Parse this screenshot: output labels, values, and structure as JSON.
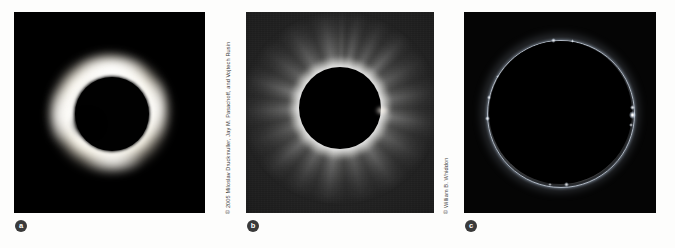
{
  "figure": {
    "background_color": "#fdfdfc",
    "panel_count": 3
  },
  "panels": [
    {
      "id": "a",
      "label": "a",
      "credit": "Jay M. Pasachoff and Shelly B. Kimmel, Williams College Expedition",
      "description": "inner corona and chromosphere ring around dark lunar disk",
      "sky_color": "#000000",
      "corona_color": "#fffdf6",
      "moon_color": "#010101"
    },
    {
      "id": "b",
      "label": "b",
      "credit": "© 2005 Miloslav Druckmuller, Jay M. Pasachoff, and Vojtech Rusin",
      "description": "processed white-light corona with radial streamers",
      "sky_color": "#1c1c1c",
      "corona_color": "#ffffff",
      "moon_color": "#000000"
    },
    {
      "id": "c",
      "label": "c",
      "credit": "© William B. Whiddon",
      "description": "thin bright chromospheric ring with Baily's beads",
      "sky_color": "#050505",
      "corona_color": "#d7e1f0",
      "moon_color": "#000000"
    }
  ],
  "beads": {
    "panel_c": [
      {
        "angle_deg": 92,
        "size": 4.0,
        "intensity": 1.0
      },
      {
        "angle_deg": 86,
        "size": 2.6,
        "intensity": 0.85
      },
      {
        "angle_deg": 100,
        "size": 2.0,
        "intensity": 0.7
      },
      {
        "angle_deg": 175,
        "size": 2.4,
        "intensity": 0.8
      },
      {
        "angle_deg": 188,
        "size": 1.8,
        "intensity": 0.6
      },
      {
        "angle_deg": 265,
        "size": 2.8,
        "intensity": 0.85
      },
      {
        "angle_deg": 282,
        "size": 2.2,
        "intensity": 0.75
      },
      {
        "angle_deg": 300,
        "size": 1.8,
        "intensity": 0.6
      },
      {
        "angle_deg": 355,
        "size": 2.6,
        "intensity": 0.8
      },
      {
        "angle_deg": 10,
        "size": 2.0,
        "intensity": 0.65
      }
    ]
  }
}
